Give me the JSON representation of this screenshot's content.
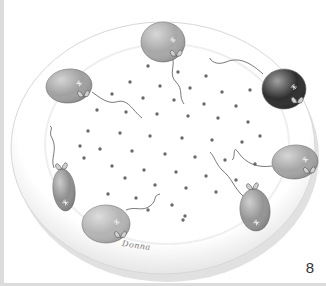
{
  "page": {
    "number": "8",
    "signature": "Donna"
  },
  "plate": {
    "cx": 163,
    "cy": 148,
    "rx": 152,
    "ry": 126,
    "rim_color": "#f2f2f2",
    "shadow_color": "#c8c8c8",
    "surface_color": "#ffffff"
  },
  "balloons": [
    {
      "name": "top-balloon",
      "shape": "round",
      "cx": 163,
      "cy": 42,
      "rx": 22,
      "ry": 20,
      "fill": "#a8a8a8",
      "rot": 0
    },
    {
      "name": "upper-left-balloon",
      "shape": "round",
      "cx": 69,
      "cy": 86,
      "rx": 23,
      "ry": 17,
      "fill": "#a0a0a0",
      "rot": -5
    },
    {
      "name": "upper-right-balloon",
      "shape": "round",
      "cx": 284,
      "cy": 89,
      "rx": 22,
      "ry": 20,
      "fill": "#2e2e2e",
      "rot": 0
    },
    {
      "name": "left-long-balloon",
      "shape": "long",
      "cx": 64,
      "cy": 190,
      "rx": 11,
      "ry": 21,
      "fill": "#8e8e8e",
      "rot": -6
    },
    {
      "name": "bottom-left-balloon",
      "shape": "round",
      "cx": 106,
      "cy": 224,
      "rx": 24,
      "ry": 19,
      "fill": "#b4b4b4",
      "rot": 0
    },
    {
      "name": "right-balloon",
      "shape": "round",
      "cx": 295,
      "cy": 162,
      "rx": 23,
      "ry": 17,
      "fill": "#a4a4a4",
      "rot": -4
    },
    {
      "name": "lower-right-balloon",
      "shape": "long",
      "cx": 255,
      "cy": 210,
      "rx": 15,
      "ry": 21,
      "fill": "#949494",
      "rot": -6
    }
  ],
  "dots": {
    "color": "#6a6a6a",
    "radius": 1.7,
    "points": [
      [
        148,
        66
      ],
      [
        178,
        72
      ],
      [
        206,
        76
      ],
      [
        130,
        82
      ],
      [
        160,
        86
      ],
      [
        190,
        88
      ],
      [
        222,
        92
      ],
      [
        250,
        90
      ],
      [
        112,
        94
      ],
      [
        143,
        98
      ],
      [
        174,
        100
      ],
      [
        204,
        104
      ],
      [
        236,
        106
      ],
      [
        97,
        110
      ],
      [
        126,
        112
      ],
      [
        157,
        114
      ],
      [
        188,
        116
      ],
      [
        218,
        118
      ],
      [
        248,
        122
      ],
      [
        88,
        131
      ],
      [
        120,
        133
      ],
      [
        150,
        136
      ],
      [
        182,
        138
      ],
      [
        212,
        140
      ],
      [
        242,
        142
      ],
      [
        260,
        136
      ],
      [
        80,
        146
      ],
      [
        100,
        149
      ],
      [
        132,
        151
      ],
      [
        165,
        154
      ],
      [
        195,
        157
      ],
      [
        225,
        160
      ],
      [
        255,
        164
      ],
      [
        84,
        158
      ],
      [
        112,
        166
      ],
      [
        144,
        170
      ],
      [
        176,
        172
      ],
      [
        206,
        176
      ],
      [
        236,
        180
      ],
      [
        125,
        178
      ],
      [
        155,
        185
      ],
      [
        186,
        188
      ],
      [
        216,
        192
      ],
      [
        108,
        194
      ],
      [
        136,
        198
      ],
      [
        172,
        205
      ],
      [
        148,
        210
      ],
      [
        185,
        216
      ],
      [
        183,
        220
      ]
    ]
  },
  "strings": [
    "M172,56 C176,66 168,74 176,82 C184,90 178,96 184,104",
    "M92,92 C100,98 108,104 116,102 C128,98 132,110 142,118",
    "M263,74 C252,64 240,56 226,62 C216,66 210,60 210,58",
    "M54,168 C50,158 58,150 52,138 C48,132 54,128 50,126",
    "M126,210 C136,206 142,212 150,206 C158,200 152,196 160,194",
    "M272,166 C258,168 246,164 238,152 C232,144 236,158 232,160",
    "M243,196 C234,188 232,178 222,170 C216,164 214,156 210,152"
  ]
}
